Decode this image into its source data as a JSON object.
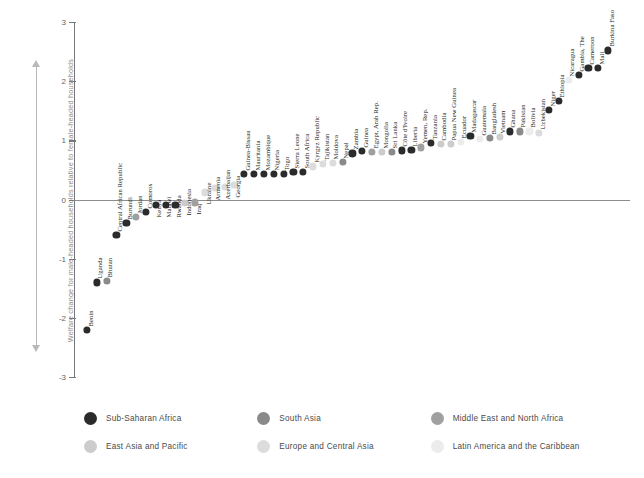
{
  "axis": {
    "y_title": "Welfare change for male-headed households relative to female-headed households",
    "ticks": [
      "3",
      "2",
      "1",
      "0",
      "-1",
      "-2",
      "-3"
    ]
  },
  "legend": {
    "items": [
      {
        "label": "Sub-Saharan Africa",
        "color": "#2b2b2b",
        "key": "ssa"
      },
      {
        "label": "South Asia",
        "color": "#8a8a8a",
        "key": "sa"
      },
      {
        "label": "Middle East and North Africa",
        "color": "#a0a0a0",
        "key": "mena"
      },
      {
        "label": "East Asia and Pacific",
        "color": "#cccccc",
        "key": "eap"
      },
      {
        "label": "Europe and Central Asia",
        "color": "#dcdcdc",
        "key": "eca"
      },
      {
        "label": "Latin America and  the Caribbean",
        "color": "#ececec",
        "key": "lac"
      }
    ]
  },
  "chart_data": {
    "type": "scatter",
    "title": "",
    "xlabel": "",
    "ylabel": "Welfare change for male-headed households relative to female-headed households",
    "ylim": [
      -3,
      3
    ],
    "yticks": [
      3,
      2,
      1,
      0,
      -1,
      -2,
      -3
    ],
    "grid": false,
    "legend_position": "bottom",
    "series": [
      {
        "name": "Sub-Saharan Africa",
        "color": "#2b2b2b"
      },
      {
        "name": "South Asia",
        "color": "#8a8a8a"
      },
      {
        "name": "Middle East and North Africa",
        "color": "#a0a0a0"
      },
      {
        "name": "East Asia and Pacific",
        "color": "#cccccc"
      },
      {
        "name": "Europe and Central Asia",
        "color": "#dcdcdc"
      },
      {
        "name": "Latin America and  the Caribbean",
        "color": "#ececec"
      }
    ],
    "points": [
      {
        "label": "Benin",
        "value": -2.2,
        "group": "ssa"
      },
      {
        "label": "Uganda",
        "value": -1.4,
        "group": "ssa"
      },
      {
        "label": "Bhutan",
        "value": -1.37,
        "group": "sa"
      },
      {
        "label": "Central African Republic",
        "value": -0.6,
        "group": "ssa"
      },
      {
        "label": "Burundi",
        "value": -0.4,
        "group": "ssa"
      },
      {
        "label": "Jordan",
        "value": -0.3,
        "group": "mena"
      },
      {
        "label": "Comoros",
        "value": -0.21,
        "group": "ssa"
      },
      {
        "label": "Kenya",
        "value": -0.09,
        "group": "ssa"
      },
      {
        "label": "Malawi",
        "value": -0.09,
        "group": "ssa"
      },
      {
        "label": "Rwanda",
        "value": -0.09,
        "group": "ssa"
      },
      {
        "label": "Indonesia",
        "value": -0.06,
        "group": "eap"
      },
      {
        "label": "Iraq",
        "value": -0.05,
        "group": "mena"
      },
      {
        "label": "Ukraine",
        "value": 0.12,
        "group": "eca"
      },
      {
        "label": "Armenia",
        "value": 0.2,
        "group": "eca"
      },
      {
        "label": "Azerbaijan",
        "value": 0.21,
        "group": "eca"
      },
      {
        "label": "Georgia",
        "value": 0.25,
        "group": "eca"
      },
      {
        "label": "Guinea-Bissau",
        "value": 0.43,
        "group": "ssa"
      },
      {
        "label": "Mauritania",
        "value": 0.43,
        "group": "ssa"
      },
      {
        "label": "Mozambique",
        "value": 0.43,
        "group": "ssa"
      },
      {
        "label": "Nigeria",
        "value": 0.43,
        "group": "ssa"
      },
      {
        "label": "Togo",
        "value": 0.43,
        "group": "ssa"
      },
      {
        "label": "Sierra Leone",
        "value": 0.47,
        "group": "ssa"
      },
      {
        "label": "South Africa",
        "value": 0.47,
        "group": "ssa"
      },
      {
        "label": "Kyrgyz Republic",
        "value": 0.56,
        "group": "eca"
      },
      {
        "label": "Tajikistan",
        "value": 0.6,
        "group": "eca"
      },
      {
        "label": "Moldova",
        "value": 0.62,
        "group": "eca"
      },
      {
        "label": "Nepal",
        "value": 0.64,
        "group": "sa"
      },
      {
        "label": "Zambia",
        "value": 0.78,
        "group": "ssa"
      },
      {
        "label": "Guinea",
        "value": 0.82,
        "group": "ssa"
      },
      {
        "label": "Egypt, Arab Rep.",
        "value": 0.8,
        "group": "mena"
      },
      {
        "label": "Mongolia",
        "value": 0.8,
        "group": "eap"
      },
      {
        "label": "Sri Lanka",
        "value": 0.8,
        "group": "sa"
      },
      {
        "label": "Côte d'Ivoire",
        "value": 0.83,
        "group": "ssa"
      },
      {
        "label": "Liberia",
        "value": 0.84,
        "group": "ssa"
      },
      {
        "label": "Yemen, Rep.",
        "value": 0.88,
        "group": "mena"
      },
      {
        "label": "Tanzania",
        "value": 0.96,
        "group": "ssa"
      },
      {
        "label": "Cambodia",
        "value": 0.94,
        "group": "eap"
      },
      {
        "label": "Papua New Guinea",
        "value": 0.94,
        "group": "eap"
      },
      {
        "label": "Ecuador",
        "value": 0.98,
        "group": "lac"
      },
      {
        "label": "Madagascar",
        "value": 1.08,
        "group": "ssa"
      },
      {
        "label": "Guatemala",
        "value": 1.02,
        "group": "lac"
      },
      {
        "label": "Bangladesh",
        "value": 1.04,
        "group": "sa"
      },
      {
        "label": "Vietnam",
        "value": 1.06,
        "group": "eap"
      },
      {
        "label": "Ghana",
        "value": 1.15,
        "group": "ssa"
      },
      {
        "label": "Pakistan",
        "value": 1.15,
        "group": "sa"
      },
      {
        "label": "Bolivia",
        "value": 1.15,
        "group": "lac"
      },
      {
        "label": "Uzbekistan",
        "value": 1.13,
        "group": "eca"
      },
      {
        "label": "Niger",
        "value": 1.52,
        "group": "ssa"
      },
      {
        "label": "Ethiopia",
        "value": 1.66,
        "group": "ssa"
      },
      {
        "label": "Nicaragua",
        "value": 2.02,
        "group": "lac"
      },
      {
        "label": "Gambia, The",
        "value": 2.1,
        "group": "ssa"
      },
      {
        "label": "Cameroon",
        "value": 2.22,
        "group": "ssa"
      },
      {
        "label": "Mali",
        "value": 2.22,
        "group": "ssa"
      },
      {
        "label": "Burkina Faso",
        "value": 2.52,
        "group": "ssa"
      }
    ]
  }
}
